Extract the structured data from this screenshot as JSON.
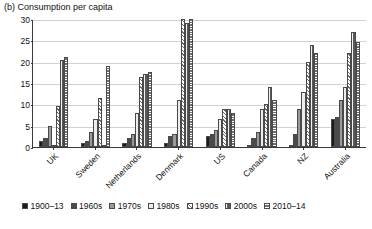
{
  "caption": "(b) Consumption per capita",
  "chart_data": {
    "type": "bar",
    "title": "(b) Consumption per capita",
    "xlabel": "",
    "ylabel": "",
    "ylim": [
      0,
      30
    ],
    "yticks": [
      0,
      5,
      10,
      15,
      20,
      25,
      30
    ],
    "grid": true,
    "legend_position": "bottom",
    "categories": [
      "UK",
      "Sweden",
      "Netherlands",
      "Denmark",
      "US",
      "Canada",
      "NZ",
      "Australia"
    ],
    "series": [
      {
        "name": "1900–13",
        "values": [
          1.5,
          1.0,
          1.0,
          1.0,
          2.5,
          0.5,
          0.5,
          6.5
        ]
      },
      {
        "name": "1960s",
        "values": [
          2.0,
          1.5,
          2.0,
          2.5,
          3.0,
          2.0,
          3.0,
          7.0
        ]
      },
      {
        "name": "1970s",
        "values": [
          5.0,
          3.5,
          3.0,
          3.0,
          4.0,
          3.5,
          9.0,
          11.0
        ]
      },
      {
        "name": "1980s",
        "values": [
          0.5,
          6.5,
          8.0,
          11.0,
          6.5,
          9.0,
          13.0,
          14.0
        ]
      },
      {
        "name": "1990s",
        "values": [
          9.5,
          11.5,
          16.5,
          30.0,
          9.0,
          10.0,
          20.0,
          22.0
        ]
      },
      {
        "name": "2000s",
        "values": [
          20.5,
          0.5,
          17.0,
          29.0,
          9.0,
          14.0,
          24.0,
          27.0
        ]
      },
      {
        "name": "2010–14",
        "values": [
          21.0,
          19.0,
          17.5,
          30.0,
          8.0,
          11.0,
          22.0,
          24.5
        ]
      }
    ]
  },
  "legend": {
    "items": [
      {
        "label": "1900–13"
      },
      {
        "label": "1960s"
      },
      {
        "label": "1970s"
      },
      {
        "label": "1980s"
      },
      {
        "label": "1990s"
      },
      {
        "label": "2000s"
      },
      {
        "label": "2010–14"
      }
    ]
  }
}
